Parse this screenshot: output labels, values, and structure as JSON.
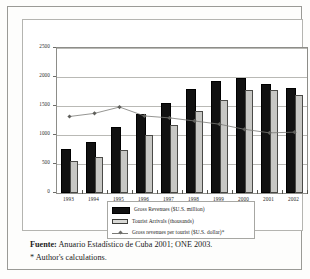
{
  "chart_data": {
    "type": "bar",
    "title": "",
    "xlabel": "",
    "ylabel": "",
    "ylim": [
      0,
      2500
    ],
    "yticks": [
      "0",
      "500",
      "1000",
      "1500",
      "2000",
      "2500"
    ],
    "grid": true,
    "legend_position": "bottom",
    "categories": [
      "1993",
      "1994",
      "1995",
      "1996",
      "1997",
      "1998",
      "1999",
      "2000",
      "2001",
      "2002"
    ],
    "series": [
      {
        "name": "Gross Revenues ($U.S. million)",
        "type": "bar",
        "color": "#111111",
        "values": [
          720,
          850,
          1100,
          1333,
          1515,
          1759,
          1901,
          1948,
          1840,
          1769
        ]
      },
      {
        "name": "Tourist Arrivals (thousands)",
        "type": "bar",
        "color": "#c7c7c4",
        "values": [
          546,
          619,
          742,
          1004,
          1170,
          1416,
          1603,
          1774,
          1774,
          1686
        ]
      },
      {
        "name": "Gross revenues per tourist ($U.S. dollar)*",
        "type": "line",
        "color": "#7a7a76",
        "values": [
          1319,
          1373,
          1482,
          1328,
          1295,
          1242,
          1186,
          1098,
          1037,
          1049
        ]
      }
    ]
  },
  "footer": {
    "source_label": "Fuente:",
    "source_text": " Anuario Estadístico de Cuba 2001; ONE 2003.",
    "note": "* Author's calculations."
  }
}
